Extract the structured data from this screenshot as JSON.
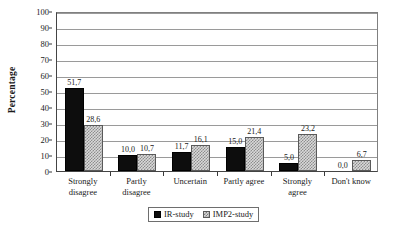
{
  "chart_data": {
    "type": "bar",
    "title": "",
    "subtitle": "",
    "xlabel": "",
    "ylabel": "Percentage",
    "ylim": [
      0,
      100
    ],
    "ytick_step": 10,
    "ytick_labels": [
      "0",
      "10",
      "20",
      "30",
      "40",
      "50",
      "60",
      "70",
      "80",
      "90",
      "100"
    ],
    "grid": true,
    "grid_axis": "y",
    "legend_position": "bottom-center",
    "decimal_separator": ",",
    "categories": [
      "Strongly disagree",
      "Partly disagree",
      "Uncertain",
      "Partly agree",
      "Strongly agree",
      "Don't know"
    ],
    "category_lines": [
      [
        "Strongly",
        "disagree"
      ],
      [
        "Partly",
        "disagree"
      ],
      [
        "Uncertain"
      ],
      [
        "Partly agree"
      ],
      [
        "Strongly",
        "agree"
      ],
      [
        "Don't know"
      ]
    ],
    "series": [
      {
        "name": "IR-study",
        "color": "#0d0d0d",
        "pattern": "solid",
        "values": [
          51.7,
          10.0,
          11.7,
          15.0,
          5.0,
          0.0
        ],
        "labels": [
          "51,7",
          "10,0",
          "11,7",
          "15,0",
          "5,0",
          "0,0"
        ]
      },
      {
        "name": "IMP2-study",
        "color": "#d9d9d9",
        "pattern": "checker",
        "values": [
          28.6,
          10.7,
          16.1,
          21.4,
          23.2,
          6.7
        ],
        "labels": [
          "28,6",
          "10,7",
          "16,1",
          "21,4",
          "23,2",
          "6,7"
        ]
      }
    ]
  },
  "legend": {
    "entries": [
      {
        "label": "IR-study"
      },
      {
        "label": "IMP2-study"
      }
    ]
  },
  "axes": {
    "y_title": "Percentage"
  }
}
